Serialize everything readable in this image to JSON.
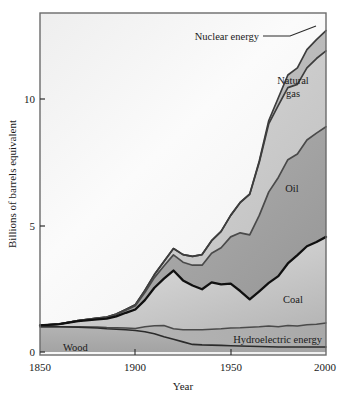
{
  "chart_data": {
    "type": "area",
    "stacked": true,
    "title": "",
    "xlabel": "Year",
    "ylabel": "Billions of barrels equivalent",
    "xlim": [
      1850,
      2000
    ],
    "ylim": [
      0,
      12.6
    ],
    "xticks": [
      1850,
      1900,
      1950,
      2000
    ],
    "xticklabels": [
      "1850",
      "1900",
      "1950",
      "2000"
    ],
    "yticks": [
      0,
      5,
      10
    ],
    "yticklabels": [
      "0",
      "5",
      "10"
    ],
    "minor_xticks": [
      1900,
      1950
    ],
    "grid": false,
    "legend": "inline-labels",
    "x": [
      1850,
      1860,
      1870,
      1880,
      1885,
      1890,
      1895,
      1900,
      1905,
      1910,
      1915,
      1920,
      1925,
      1930,
      1935,
      1940,
      1945,
      1950,
      1955,
      1960,
      1965,
      1970,
      1975,
      1980,
      1985,
      1990,
      1995,
      2000
    ],
    "series": [
      {
        "name": "Wood",
        "label": "Wood",
        "fill": "#a8a8a8",
        "values": [
          1.0,
          1.0,
          0.98,
          0.95,
          0.92,
          0.9,
          0.88,
          0.85,
          0.8,
          0.72,
          0.6,
          0.5,
          0.4,
          0.3,
          0.28,
          0.27,
          0.26,
          0.25,
          0.24,
          0.23,
          0.22,
          0.21,
          0.2,
          0.2,
          0.2,
          0.2,
          0.2,
          0.2
        ]
      },
      {
        "name": "Hydroelectric energy",
        "label": "Hydroelectric energy",
        "fill": "#b4b4b4",
        "values": [
          0.0,
          0.0,
          0.02,
          0.04,
          0.05,
          0.06,
          0.07,
          0.08,
          0.2,
          0.32,
          0.45,
          0.42,
          0.48,
          0.58,
          0.6,
          0.63,
          0.66,
          0.7,
          0.72,
          0.75,
          0.78,
          0.82,
          0.8,
          0.85,
          0.83,
          0.88,
          0.9,
          0.95
        ]
      },
      {
        "name": "Coal",
        "label": "Coal",
        "fill": "#bdbdbd",
        "values": [
          0.05,
          0.1,
          0.22,
          0.3,
          0.35,
          0.45,
          0.6,
          0.75,
          1.05,
          1.5,
          1.85,
          2.3,
          1.95,
          1.75,
          1.6,
          1.85,
          1.75,
          1.75,
          1.45,
          1.1,
          1.4,
          1.7,
          2.0,
          2.45,
          2.8,
          3.1,
          3.25,
          3.4
        ]
      },
      {
        "name": "Oil",
        "label": "Oil",
        "fill": "#999999",
        "values": [
          0.0,
          0.0,
          0.02,
          0.04,
          0.05,
          0.07,
          0.1,
          0.15,
          0.3,
          0.4,
          0.5,
          0.62,
          0.72,
          0.8,
          0.95,
          1.15,
          1.45,
          1.85,
          2.3,
          2.55,
          3.0,
          3.6,
          3.9,
          4.1,
          4.0,
          4.2,
          4.3,
          4.35
        ]
      },
      {
        "name": "Natural gas",
        "label": "Natural gas",
        "fill": "#c9c9c9",
        "values": [
          0.0,
          0.0,
          0.0,
          0.01,
          0.01,
          0.02,
          0.03,
          0.04,
          0.08,
          0.12,
          0.18,
          0.25,
          0.3,
          0.35,
          0.42,
          0.5,
          0.65,
          0.85,
          1.2,
          1.6,
          2.1,
          2.7,
          2.85,
          2.85,
          2.75,
          2.85,
          2.95,
          3.0
        ]
      },
      {
        "name": "Nuclear energy",
        "label": "Nuclear energy",
        "fill": "#b0b0b0",
        "values": [
          0.0,
          0.0,
          0.0,
          0.0,
          0.0,
          0.0,
          0.0,
          0.0,
          0.0,
          0.0,
          0.0,
          0.0,
          0.0,
          0.0,
          0.0,
          0.0,
          0.0,
          0.0,
          0.0,
          0.02,
          0.05,
          0.12,
          0.3,
          0.5,
          0.65,
          0.72,
          0.75,
          0.8
        ]
      }
    ],
    "annotations": [
      {
        "text": "Nuclear energy",
        "kind": "callout-with-leader-line"
      },
      {
        "text": "Natural gas",
        "kind": "inline"
      },
      {
        "text": "Oil",
        "kind": "inline"
      },
      {
        "text": "Coal",
        "kind": "inline"
      },
      {
        "text": "Hydroelectric energy",
        "kind": "inline"
      },
      {
        "text": "Wood",
        "kind": "inline"
      }
    ],
    "colors": {
      "frame": "#555555",
      "plot_background": "#f2f2f2",
      "outline_dark": "#1a1a1a",
      "outline_mid": "#4a4a4a",
      "text": "#1a1a1a"
    }
  },
  "axes": {
    "y_title": "Billions of barrels equivalent",
    "x_title": "Year",
    "y_tick_0": "0",
    "y_tick_5": "5",
    "y_tick_10": "10",
    "x_tick_1850": "1850",
    "x_tick_1900": "1900",
    "x_tick_1950": "1950",
    "x_tick_2000": "2000"
  },
  "labels": {
    "nuclear": "Nuclear energy",
    "natural_gas_line1": "Natural",
    "natural_gas_line2": "gas",
    "oil": "Oil",
    "coal": "Coal",
    "hydro": "Hydroelectric energy",
    "wood": "Wood"
  }
}
